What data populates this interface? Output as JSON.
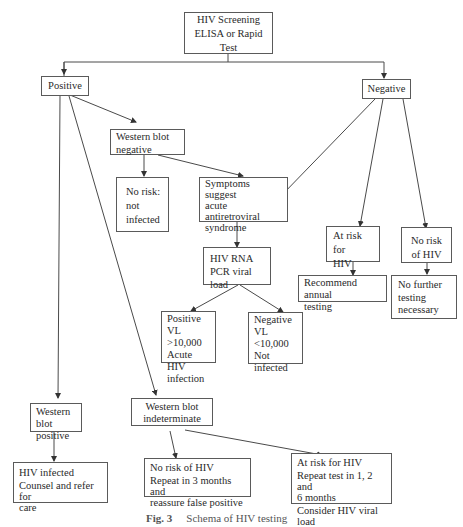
{
  "diagram": {
    "type": "flowchart",
    "nodes": {
      "screening": {
        "lines": [
          "HIV Screening",
          "ELISA or Rapid",
          "Test"
        ]
      },
      "positive": {
        "lines": [
          "Positive"
        ]
      },
      "negative": {
        "lines": [
          "Negative"
        ]
      },
      "wb_negative": {
        "lines": [
          "Western blot",
          "negative"
        ]
      },
      "no_risk_not_infected": {
        "lines": [
          "No risk:",
          "not",
          "infected"
        ]
      },
      "symptoms": {
        "lines": [
          "Symptoms suggest",
          "acute",
          "antiretroviral",
          "syndrome"
        ]
      },
      "at_risk": {
        "lines": [
          "At risk for",
          "HIV"
        ]
      },
      "no_risk_hiv": {
        "lines": [
          "No risk",
          "of HIV"
        ]
      },
      "recommend": {
        "lines": [
          "Recommend annual",
          "testing"
        ]
      },
      "no_further": {
        "lines": [
          "No further",
          "testing",
          "necessary"
        ]
      },
      "rna_pcr": {
        "lines": [
          "HIV RNA",
          "PCR viral load"
        ]
      },
      "vl_positive": {
        "lines": [
          "Positive",
          "VL >10,000",
          "Acute HIV",
          "infection"
        ]
      },
      "vl_negative": {
        "lines": [
          "Negative",
          "VL <10,000",
          "Not",
          "infected"
        ]
      },
      "wb_positive": {
        "lines": [
          "Western blot",
          "positive"
        ]
      },
      "wb_indeterminate": {
        "lines": [
          "Western blot",
          "indeterminate"
        ]
      },
      "hiv_infected": {
        "lines": [
          "HIV infected",
          "Counsel and refer for",
          "care"
        ]
      },
      "indet_no_risk": {
        "lines": [
          "No risk of HIV",
          "Repeat in 3 months and",
          "reassure false positive"
        ]
      },
      "indet_at_risk": {
        "lines": [
          "At risk for HIV",
          "Repeat test in 1, 2 and",
          "6 months",
          "Consider HIV viral load"
        ]
      }
    },
    "edges": [
      [
        "screening",
        "positive"
      ],
      [
        "screening",
        "negative"
      ],
      [
        "positive",
        "wb_negative"
      ],
      [
        "positive",
        "wb_positive"
      ],
      [
        "positive",
        "wb_indeterminate"
      ],
      [
        "wb_negative",
        "no_risk_not_infected"
      ],
      [
        "wb_negative",
        "symptoms"
      ],
      [
        "negative",
        "symptoms"
      ],
      [
        "negative",
        "at_risk"
      ],
      [
        "negative",
        "no_risk_hiv"
      ],
      [
        "at_risk",
        "recommend"
      ],
      [
        "no_risk_hiv",
        "no_further"
      ],
      [
        "symptoms",
        "rna_pcr"
      ],
      [
        "rna_pcr",
        "vl_positive"
      ],
      [
        "rna_pcr",
        "vl_negative"
      ],
      [
        "wb_positive",
        "hiv_infected"
      ],
      [
        "wb_indeterminate",
        "indet_no_risk"
      ],
      [
        "wb_indeterminate",
        "indet_at_risk"
      ]
    ],
    "caption": {
      "label": "Fig. 3",
      "text": "Schema of HIV testing"
    }
  }
}
